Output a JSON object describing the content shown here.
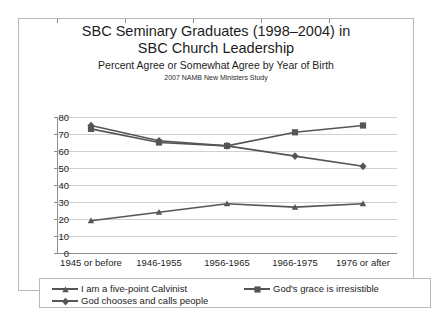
{
  "chart_data": {
    "type": "line",
    "title": "SBC Seminary Graduates (1998–2004) in SBC Church Leadership",
    "title_line1": "SBC Seminary Graduates (1998–2004) in",
    "title_line2": "SBC Church Leadership",
    "subtitle": "Percent Agree or Somewhat Agree by Year of Birth",
    "source": "2007 NAMB New Ministers Study",
    "xlabel": "",
    "ylabel": "",
    "ylim": [
      0,
      80
    ],
    "yticks": [
      0,
      10,
      20,
      30,
      40,
      50,
      60,
      70,
      80
    ],
    "grid": true,
    "legend_position": "bottom",
    "categories": [
      "1945 or before",
      "1946-1955",
      "1956-1965",
      "1966-1975",
      "1976 or after"
    ],
    "series": [
      {
        "name": "I am a five-point Calvinist",
        "marker": "triangle",
        "color": "#555555",
        "values": [
          19,
          24,
          29,
          27,
          29
        ]
      },
      {
        "name": "God's grace is irresistible",
        "marker": "square",
        "color": "#555555",
        "values": [
          73,
          65,
          63,
          71,
          75
        ]
      },
      {
        "name": "God chooses and calls people",
        "marker": "diamond",
        "color": "#555555",
        "values": [
          75,
          66,
          63,
          57,
          51
        ]
      }
    ]
  },
  "legend": {
    "items": [
      "I am a five-point Calvinist",
      "God's grace is irresistible",
      "God chooses and calls people"
    ]
  }
}
